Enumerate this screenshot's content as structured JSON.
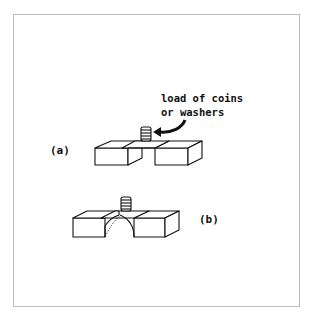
{
  "figure": {
    "annotation": {
      "line1": "load of coins",
      "line2": "or washers"
    },
    "panels": [
      {
        "label": "(a)",
        "description": "paper bridge resting flat across two blocks with a stack of coins on top"
      },
      {
        "label": "(b)",
        "description": "paper bridge with folded arch support beneath, across two blocks, coin stack on top"
      }
    ],
    "icons": {
      "coin_stack": "coin-stack-icon",
      "arrow": "curved-arrow-icon"
    },
    "colors": {
      "stroke": "#111111",
      "frame": "#bdbdbd",
      "background": "#ffffff"
    }
  }
}
